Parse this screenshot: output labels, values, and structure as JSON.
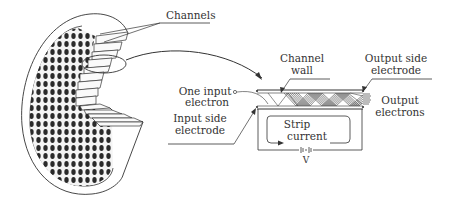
{
  "diagram": {
    "labels": {
      "channels": "Channels",
      "channel_wall_1": "Channel",
      "channel_wall_2": "wall",
      "output_electrode_1": "Output side",
      "output_electrode_2": "electrode",
      "input_electron_1": "One input",
      "input_electron_2": "electron",
      "input_electrode_1": "Input side",
      "input_electrode_2": "electrode",
      "output_electrons_1": "Output",
      "output_electrons_2": "electrons",
      "strip_current_1": "Strip",
      "strip_current_2": "current",
      "voltage": "V"
    },
    "colors": {
      "line": "#333333",
      "fill_dark": "#2a2a2a",
      "background": "#ffffff"
    }
  }
}
